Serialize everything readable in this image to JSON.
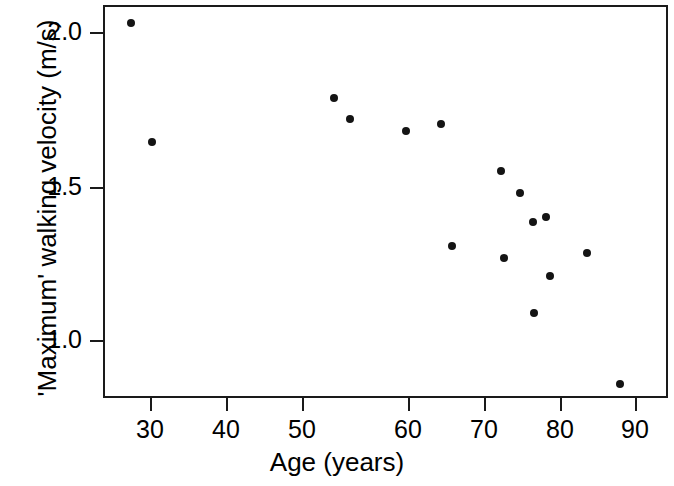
{
  "chart_data": {
    "type": "scatter",
    "title": "",
    "xlabel": "Age (years)",
    "ylabel": "'Maximum' walking velocity (m/s)",
    "xlim": [
      25.5,
      91.5
    ],
    "ylim": [
      0.79,
      2.14
    ],
    "grid": false,
    "legend": null,
    "xticks": [
      30,
      40,
      50,
      60,
      70,
      80,
      90
    ],
    "xtick_labels": [
      "30",
      "40",
      "50",
      "60",
      "70",
      "80",
      "90"
    ],
    "yticks": [
      1.0,
      1.5,
      2.0
    ],
    "ytick_labels": [
      "1.0",
      "1.5",
      "2.0"
    ],
    "marker": "filled-circle",
    "marker_color": "#141414",
    "series": [
      {
        "name": "subjects",
        "x": [
          27.3,
          30.0,
          51.2,
          53.3,
          60.4,
          64.3,
          65.0,
          70.9,
          71.9,
          73.2,
          74.7,
          75.2,
          76.1,
          76.6,
          81.1,
          85.2
        ],
        "y": [
          2.08,
          1.67,
          1.83,
          1.75,
          1.71,
          1.73,
          1.31,
          1.57,
          1.27,
          1.49,
          1.09,
          1.4,
          1.42,
          1.22,
          1.29,
          0.86
        ]
      }
    ],
    "points_px": [
      {
        "cx": 129,
        "cy": 21
      },
      {
        "cx": 150,
        "cy": 140
      },
      {
        "cx": 332,
        "cy": 96
      },
      {
        "cx": 348,
        "cy": 117
      },
      {
        "cx": 404,
        "cy": 129
      },
      {
        "cx": 439,
        "cy": 122
      },
      {
        "cx": 450,
        "cy": 244
      },
      {
        "cx": 499,
        "cy": 169
      },
      {
        "cx": 502,
        "cy": 256
      },
      {
        "cx": 518,
        "cy": 191
      },
      {
        "cx": 532,
        "cy": 311
      },
      {
        "cx": 531,
        "cy": 220
      },
      {
        "cx": 544,
        "cy": 215
      },
      {
        "cx": 548,
        "cy": 274
      },
      {
        "cx": 585,
        "cy": 251
      },
      {
        "cx": 618,
        "cy": 382
      }
    ],
    "ytick_px": [
      32,
      187,
      340
    ],
    "xtick_px": [
      150,
      226,
      302,
      408,
      484,
      560,
      635
    ]
  },
  "axes": {
    "y": {
      "ticks": [
        {
          "label": "2.0",
          "py": 32
        },
        {
          "label": "1.5",
          "py": 187
        },
        {
          "label": "1.0",
          "py": 340
        }
      ],
      "title": "'Maximum' walking velocity (m/s)"
    },
    "x": {
      "ticks": [
        {
          "label": "30",
          "px": 150
        },
        {
          "label": "40",
          "px": 226
        },
        {
          "label": "50",
          "px": 302
        },
        {
          "label": "60",
          "px": 408
        },
        {
          "label": "70",
          "px": 484
        },
        {
          "label": "80",
          "px": 560
        },
        {
          "label": "90",
          "px": 635
        }
      ],
      "title": "Age (years)"
    }
  }
}
